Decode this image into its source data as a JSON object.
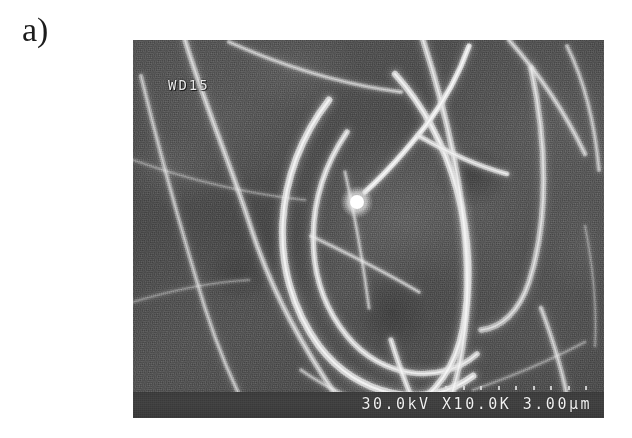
{
  "figure": {
    "panel_label": "a)",
    "kind": "sem-micrograph"
  },
  "micrograph": {
    "overlay_wd": "WD15",
    "caption": "30.0kV X10.0K 3.00μm",
    "caption_parts": {
      "accelerating_voltage": "30.0kV",
      "magnification": "X10.0K",
      "scale_bar": "3.00μm"
    },
    "colors": {
      "background_dark": "#4a4a4a",
      "background_mid": "#585858",
      "background_light": "#787878",
      "fibre_bright": "#e6e6e6",
      "caption_bar": "#3c3c3c",
      "overlay_text": "#e8e8e8",
      "page": "#ffffff",
      "label_text": "#1c1c1c"
    },
    "fibres": [
      {
        "name": "fibre-left-arc",
        "d": "M 52 0 C 70 60, 96 120, 118 188 C 140 256, 172 310, 206 360",
        "w": 5.0,
        "o": 0.62
      },
      {
        "name": "fibre-left-edge-long",
        "d": "M 8 36 C 26 110, 48 190, 72 268 C 88 318, 104 352, 118 378",
        "w": 4.2,
        "o": 0.5
      },
      {
        "name": "fibre-loop-outer",
        "d": "M 196 60 C 140 132, 132 232, 186 306 C 224 356, 292 372, 340 336",
        "w": 6.5,
        "o": 0.88
      },
      {
        "name": "fibre-loop-inner",
        "d": "M 214 92 C 170 156, 168 240, 214 296 C 248 338, 308 346, 344 314",
        "w": 5.2,
        "o": 0.8
      },
      {
        "name": "fibre-loop-right",
        "d": "M 262 34 C 318 96, 348 196, 330 288 C 322 330, 300 356, 272 372",
        "w": 6.0,
        "o": 0.85
      },
      {
        "name": "fibre-right-vertical",
        "d": "M 290 0 C 316 80, 336 170, 334 258 C 332 312, 322 350, 310 378",
        "w": 5.6,
        "o": 0.72
      },
      {
        "name": "fibre-catalyst-stem",
        "d": "M 232 152 C 252 134, 272 112, 294 84 C 312 60, 326 34, 336 6",
        "w": 5.0,
        "o": 0.95
      },
      {
        "name": "fibre-branch-upper",
        "d": "M 286 96 C 314 112, 344 126, 374 134",
        "w": 4.4,
        "o": 0.8
      },
      {
        "name": "fibre-cross-diagonal",
        "d": "M 96 2 C 150 26, 206 44, 268 52",
        "w": 4.0,
        "o": 0.55
      },
      {
        "name": "fibre-top-right-1",
        "d": "M 376 0 C 406 34, 432 72, 452 114",
        "w": 4.6,
        "o": 0.6
      },
      {
        "name": "fibre-top-right-2",
        "d": "M 434 6 C 452 42, 462 86, 466 130",
        "w": 4.0,
        "o": 0.52
      },
      {
        "name": "fibre-right-hook",
        "d": "M 398 28 C 414 102, 416 180, 396 242 C 386 272, 368 288, 348 290",
        "w": 5.4,
        "o": 0.66
      },
      {
        "name": "fibre-right-lower",
        "d": "M 408 268 C 420 300, 430 332, 436 366",
        "w": 4.6,
        "o": 0.58
      },
      {
        "name": "fibre-bottom-stem",
        "d": "M 258 300 C 268 332, 278 358, 288 378",
        "w": 5.0,
        "o": 0.78
      },
      {
        "name": "fibre-bottom-left",
        "d": "M 168 330 C 196 350, 230 364, 266 374",
        "w": 3.8,
        "o": 0.45
      },
      {
        "name": "fibre-inner-cross",
        "d": "M 178 196 C 216 214, 252 232, 286 252",
        "w": 3.6,
        "o": 0.52
      },
      {
        "name": "fibre-inner-vert",
        "d": "M 212 132 C 222 176, 230 222, 236 268",
        "w": 3.4,
        "o": 0.48
      },
      {
        "name": "fibre-faint-bg-1",
        "d": "M 0 120 C 56 140, 114 154, 172 160",
        "w": 3.0,
        "o": 0.26
      },
      {
        "name": "fibre-faint-bg-2",
        "d": "M 0 262 C 40 250, 78 242, 116 240",
        "w": 3.0,
        "o": 0.24
      },
      {
        "name": "fibre-faint-bg-3",
        "d": "M 340 350 C 380 336, 418 320, 452 302",
        "w": 3.2,
        "o": 0.28
      },
      {
        "name": "fibre-faint-bg-4",
        "d": "M 452 186 C 460 226, 464 266, 462 306",
        "w": 3.0,
        "o": 0.25
      }
    ],
    "catalyst_tip": {
      "name": "catalyst-particle",
      "cx": 224,
      "cy": 162,
      "r": 7
    },
    "scale_tick_count": 9
  }
}
